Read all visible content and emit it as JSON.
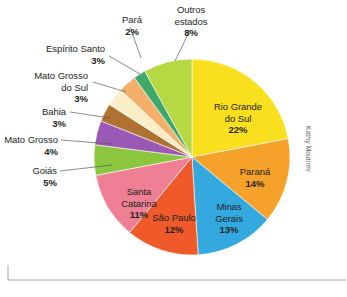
{
  "credit": "Kathy Moutinhi",
  "chart_data": {
    "type": "pie",
    "title": "",
    "subtitle": "",
    "xlabel": "",
    "ylabel": "",
    "legend_position": "none",
    "grid": false,
    "value_unit": "%",
    "categories": [
      "Rio Grande do Sul",
      "Paraná",
      "Minas Gerais",
      "São Paulo",
      "Santa Catarina",
      "Goiás",
      "Mato Grosso",
      "Bahia",
      "Mato Grosso do Sul",
      "Espírito Santo",
      "Pará",
      "Outros estados"
    ],
    "values": [
      22,
      14,
      13,
      12,
      11,
      5,
      4,
      3,
      3,
      3,
      2,
      8
    ],
    "colors": [
      "#f9e01e",
      "#f6a22a",
      "#33a9e0",
      "#f05a2a",
      "#ef7f95",
      "#8cc63e",
      "#9b59b6",
      "#b07232",
      "#faeec7",
      "#f2b06a",
      "#3fa96b",
      "#b5d843"
    ],
    "slices": [
      {
        "label": "Rio Grande do Sul",
        "value": 22,
        "percent_text": "22%",
        "color": "#f9e01e",
        "label_placement": "inside"
      },
      {
        "label": "Paraná",
        "value": 14,
        "percent_text": "14%",
        "color": "#f6a22a",
        "label_placement": "inside"
      },
      {
        "label": "Minas Gerais",
        "value": 13,
        "percent_text": "13%",
        "color": "#33a9e0",
        "label_placement": "inside"
      },
      {
        "label": "São Paulo",
        "value": 12,
        "percent_text": "12%",
        "color": "#f05a2a",
        "label_placement": "inside"
      },
      {
        "label": "Santa Catarina",
        "value": 11,
        "percent_text": "11%",
        "color": "#ef7f95",
        "label_placement": "inside"
      },
      {
        "label": "Goiás",
        "value": 5,
        "percent_text": "5%",
        "color": "#8cc63e",
        "label_placement": "outside"
      },
      {
        "label": "Mato Grosso",
        "value": 4,
        "percent_text": "4%",
        "color": "#9b59b6",
        "label_placement": "outside"
      },
      {
        "label": "Bahia",
        "value": 3,
        "percent_text": "3%",
        "color": "#b07232",
        "label_placement": "outside"
      },
      {
        "label": "Mato Grosso do Sul",
        "value": 3,
        "percent_text": "3%",
        "color": "#faeec7",
        "label_placement": "outside"
      },
      {
        "label": "Espírito Santo",
        "value": 3,
        "percent_text": "3%",
        "color": "#f2b06a",
        "label_placement": "outside"
      },
      {
        "label": "Pará",
        "value": 2,
        "percent_text": "2%",
        "color": "#3fa96b",
        "label_placement": "outside"
      },
      {
        "label": "Outros estados",
        "value": 8,
        "percent_text": "8%",
        "color": "#b5d843",
        "label_placement": "outside"
      }
    ]
  },
  "labels": {
    "rio_grande_do_sul": {
      "name": "Rio Grande",
      "name2": "do Sul",
      "pct": "22%"
    },
    "parana": {
      "name": "Paraná",
      "pct": "14%"
    },
    "minas_gerais": {
      "name": "Minas",
      "name2": "Gerais",
      "pct": "13%"
    },
    "sao_paulo": {
      "name": "São Paulo",
      "pct": "12%"
    },
    "santa_catarina": {
      "name": "Santa",
      "name2": "Catarina",
      "pct": "11%"
    },
    "goias": {
      "name": "Goiás",
      "pct": "5%"
    },
    "mato_grosso": {
      "name": "Mato Grosso",
      "pct": "4%"
    },
    "bahia": {
      "name": "Bahia",
      "pct": "3%"
    },
    "mato_grosso_do_sul": {
      "name": "Mato Grosso",
      "name2": "do Sul",
      "pct": "3%"
    },
    "espirito_santo": {
      "name": "Espírito Santo",
      "pct": "3%"
    },
    "para": {
      "name": "Pará",
      "pct": "2%"
    },
    "outros_estados": {
      "name": "Outros",
      "name2": "estados",
      "pct": "8%"
    }
  }
}
